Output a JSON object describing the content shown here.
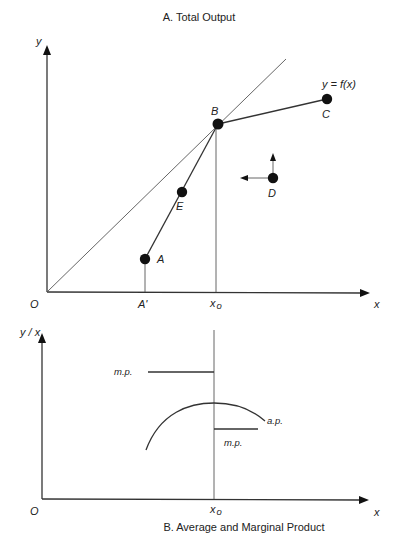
{
  "panel_a": {
    "title": "A. Total Output",
    "y_axis_label": "y",
    "x_axis_label": "x",
    "origin_label": "O",
    "function_label": "y = f(x)",
    "x_ticks": [
      {
        "label": "A'",
        "name": "a-prime"
      },
      {
        "label": "x",
        "sub": "o",
        "name": "x0"
      }
    ],
    "points": [
      {
        "id": "A",
        "label": "A"
      },
      {
        "id": "E",
        "label": "E"
      },
      {
        "id": "B",
        "label": "B"
      },
      {
        "id": "C",
        "label": "C"
      },
      {
        "id": "D",
        "label": "D"
      }
    ]
  },
  "panel_b": {
    "title": "B.  Average and Marginal Product",
    "y_axis_label": "y / x",
    "x_axis_label": "x",
    "origin_label": "O",
    "x0_label": "x",
    "x0_sub": "o",
    "mp_left_label": "m.p.",
    "mp_right_label": "m.p.",
    "ap_label": "a.p."
  },
  "colors": {
    "ink": "#222222",
    "background": "#ffffff"
  }
}
